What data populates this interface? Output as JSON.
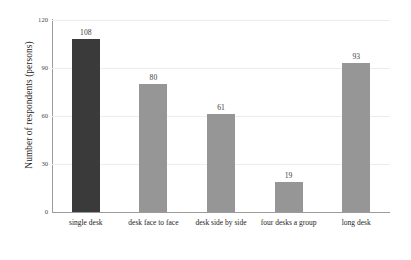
{
  "chart_data": {
    "type": "bar",
    "title": "",
    "xlabel": "",
    "ylabel": "Number of respondents (persons)",
    "categories": [
      "single desk",
      "desk face to face",
      "desk side by side",
      "four desks a group",
      "long desk"
    ],
    "values": [
      108,
      80,
      61,
      19,
      93
    ],
    "value_labels": [
      "108",
      "80",
      "61",
      "19",
      "93"
    ],
    "ylim": [
      0,
      120
    ],
    "yticks": [
      0,
      30,
      60,
      90,
      120
    ],
    "ytick_labels": [
      "0",
      "30",
      "60",
      "90",
      "120"
    ],
    "grid": true,
    "legend": "none",
    "bar_colors": [
      "#3a3a3a",
      "#969696",
      "#969696",
      "#969696",
      "#969696"
    ],
    "colors": {
      "highlight_bar": "#3a3a3a",
      "default_bar": "#969696",
      "gridline": "#ededed",
      "axis_line": "#9a9a9a",
      "text": "#1c1c1c",
      "tick_text": "#4a4a4a",
      "background": "#ffffff"
    }
  }
}
